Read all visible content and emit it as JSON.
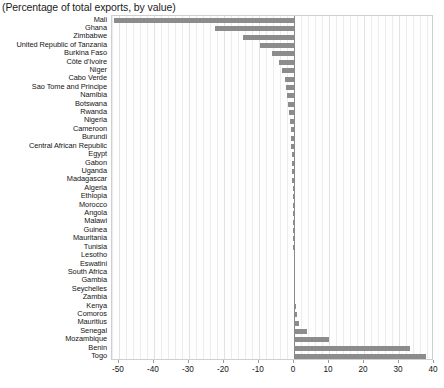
{
  "chart_title": "(Percentage of total exports, by value)",
  "colors": {
    "bar": "#8c8c8c",
    "zero_axis": "#8a8a8a",
    "gridline": "#ececec",
    "plot_background": "#fefefe",
    "text": "#141414"
  },
  "axis": {
    "ticks": [
      -50,
      -40,
      -30,
      -20,
      -10,
      0,
      10,
      20,
      30,
      40
    ],
    "tick_labels": [
      "-50",
      "-40",
      "-30",
      "-20",
      "-10",
      "0",
      "10",
      "20",
      "30",
      "40"
    ],
    "min": -52,
    "max": 40,
    "minor_step": 2,
    "major_step": 10
  },
  "chart_data": {
    "type": "bar",
    "orientation": "horizontal",
    "title": "(Percentage of total exports, by value)",
    "xlabel": "",
    "ylabel": "",
    "xlim": [
      -52,
      40
    ],
    "grid": true,
    "legend": "none",
    "categories": [
      "Mali",
      "Ghana",
      "Zimbabwe",
      "United Republic of Tanzania",
      "Burkina Faso",
      "Côte d'Ivoire",
      "Niger",
      "Cabo Verde",
      "Sao Tome and Principe",
      "Namibia",
      "Botswana",
      "Rwanda",
      "Nigeria",
      "Cameroon",
      "Burundi",
      "Central African Republic",
      "Egypt",
      "Gabon",
      "Uganda",
      "Madagascar",
      "Algeria",
      "Ethiopia",
      "Morocco",
      "Angola",
      "Malawi",
      "Guinea",
      "Mauritania",
      "Tunisia",
      "Lesotho",
      "Eswatini",
      "South Africa",
      "Gambia",
      "Seychelles",
      "Zambia",
      "Kenya",
      "Comoros",
      "Mauritius",
      "Senegal",
      "Mozambique",
      "Benin",
      "Togo"
    ],
    "values": [
      -51.5,
      -22.7,
      -14.6,
      -9.6,
      -6.4,
      -4.4,
      -3.4,
      -2.7,
      -2.3,
      -1.9,
      -1.6,
      -1.4,
      -1.2,
      -1.0,
      -0.9,
      -0.8,
      -0.7,
      -0.6,
      -0.5,
      -0.5,
      -0.4,
      -0.4,
      -0.3,
      -0.3,
      -0.3,
      -0.2,
      -0.2,
      -0.2,
      -0.1,
      -0.1,
      -0.1,
      0.2,
      0.3,
      0.4,
      0.5,
      0.8,
      1.3,
      3.6,
      10.0,
      33.2,
      37.6
    ]
  }
}
